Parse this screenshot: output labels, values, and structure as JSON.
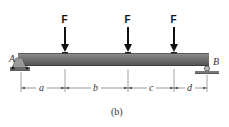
{
  "figure": {
    "caption": "(b)",
    "forces": [
      {
        "label": "F",
        "x": 65
      },
      {
        "label": "F",
        "x": 128
      },
      {
        "label": "F",
        "x": 174
      }
    ],
    "supports": {
      "left": {
        "label": "A",
        "type": "pin"
      },
      "right": {
        "label": "B",
        "type": "roller"
      }
    },
    "dimensions": [
      {
        "label": "a"
      },
      {
        "label": "b"
      },
      {
        "label": "c"
      },
      {
        "label": "d"
      }
    ],
    "colors": {
      "beam_top": "#8a8a8a",
      "beam_body": "#6e6e6e",
      "beam_bottom": "#4a4a4a",
      "arrow": "#111111",
      "dim_line": "#555555"
    }
  }
}
